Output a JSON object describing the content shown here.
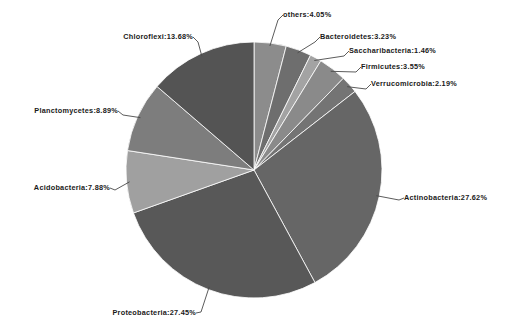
{
  "chart_data": {
    "type": "pie",
    "title": "",
    "subtitle": "",
    "xlabel": "",
    "ylabel": "",
    "legend_position": "none",
    "grid": false,
    "label_format": "name:value%",
    "units": "percent",
    "start_angle_deg": 0,
    "direction": "clockwise",
    "categories": [
      "others",
      "Bacteroidetes",
      "Saccharibacteria",
      "Firmicutes",
      "Verrucomicrobia",
      "Actinobacteria",
      "Proteobacteria",
      "Acidobacteria",
      "Planctomycetes",
      "Chloroflexi"
    ],
    "values": [
      4.05,
      3.23,
      1.46,
      3.55,
      2.19,
      27.62,
      27.45,
      7.88,
      8.89,
      13.68
    ],
    "total": 100.0,
    "colors": [
      "#8c8c8c",
      "#6e6e6e",
      "#a3a3a3",
      "#8a8a8a",
      "#747474",
      "#666666",
      "#585858",
      "#a0a0a0",
      "#7d7d7d",
      "#545454"
    ],
    "slices": [
      {
        "name": "others",
        "value": 4.05,
        "label": "others:4.05%",
        "color": "#8c8c8c"
      },
      {
        "name": "Bacteroidetes",
        "value": 3.23,
        "label": "Bacteroidetes:3.23%",
        "color": "#6e6e6e"
      },
      {
        "name": "Saccharibacteria",
        "value": 1.46,
        "label": "Saccharibacteria:1.46%",
        "color": "#a3a3a3"
      },
      {
        "name": "Firmicutes",
        "value": 3.55,
        "label": "Firmicutes:3.55%",
        "color": "#8a8a8a"
      },
      {
        "name": "Verrucomicrobia",
        "value": 2.19,
        "label": "Verrucomicrobia:2.19%",
        "color": "#747474"
      },
      {
        "name": "Actinobacteria",
        "value": 27.62,
        "label": "Actinobacteria:27.62%",
        "color": "#666666"
      },
      {
        "name": "Proteobacteria",
        "value": 27.45,
        "label": "Proteobacteria:27.45%",
        "color": "#585858"
      },
      {
        "name": "Acidobacteria",
        "value": 7.88,
        "label": "Acidobacteria:7.88%",
        "color": "#a0a0a0"
      },
      {
        "name": "Planctomycetes",
        "value": 8.89,
        "label": "Planctomycetes:8.89%",
        "color": "#7d7d7d"
      },
      {
        "name": "Chloroflexi",
        "value": 13.68,
        "label": "Chloroflexi:13.68%",
        "color": "#545454"
      }
    ],
    "geometry": {
      "center_x": 254,
      "center_y": 170,
      "radius": 128
    },
    "label_positions": [
      {
        "name": "others",
        "x": 283,
        "y": 17,
        "anchor": "start",
        "elbow_x": 278,
        "elbow_y": 20
      },
      {
        "name": "Bacteroidetes",
        "x": 320,
        "y": 39,
        "anchor": "start",
        "elbow_x": 315,
        "elbow_y": 42
      },
      {
        "name": "Saccharibacteria",
        "x": 349,
        "y": 53,
        "anchor": "start",
        "elbow_x": 344,
        "elbow_y": 56
      },
      {
        "name": "Firmicutes",
        "x": 361,
        "y": 69,
        "anchor": "start",
        "elbow_x": 356,
        "elbow_y": 72
      },
      {
        "name": "Verrucomicrobia",
        "x": 371,
        "y": 86,
        "anchor": "start",
        "elbow_x": 366,
        "elbow_y": 89
      },
      {
        "name": "Actinobacteria",
        "x": 404,
        "y": 200,
        "anchor": "start",
        "elbow_x": 399,
        "elbow_y": 200
      },
      {
        "name": "Proteobacteria",
        "x": 196,
        "y": 315,
        "anchor": "end",
        "elbow_x": 201,
        "elbow_y": 312
      },
      {
        "name": "Acidobacteria",
        "x": 110,
        "y": 190,
        "anchor": "end",
        "elbow_x": 115,
        "elbow_y": 190
      },
      {
        "name": "Planctomycetes",
        "x": 118,
        "y": 113,
        "anchor": "end",
        "elbow_x": 123,
        "elbow_y": 115
      },
      {
        "name": "Chloroflexi",
        "x": 193,
        "y": 39,
        "anchor": "end",
        "elbow_x": 198,
        "elbow_y": 42
      }
    ]
  }
}
